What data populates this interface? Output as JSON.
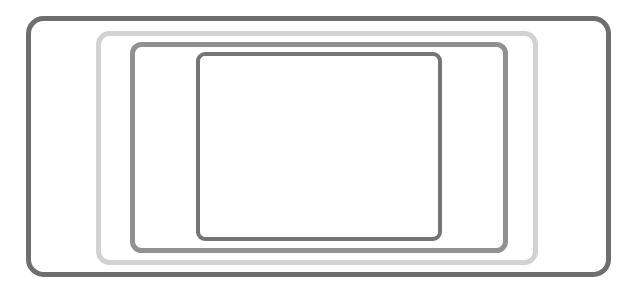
{
  "canvas": {
    "width": 637,
    "height": 293,
    "background_color": "#ffffff",
    "description": "Four nested rounded rectangle outlines of varying gray tones on a plain white background"
  },
  "figure": {
    "title": "",
    "shape_count": 4,
    "shape_kind": "rounded-rectangle-outline"
  },
  "shapes": [
    {
      "name": "outer-frame",
      "order": 1,
      "stroke_color": "#6e6e6e",
      "stroke_width": 5,
      "corner_radius": 15,
      "fill": "none",
      "x": 28.5,
      "y": 18.5,
      "width": 580,
      "height": 256
    },
    {
      "name": "second-frame",
      "order": 2,
      "stroke_color": "#d2d2d2",
      "stroke_width": 5,
      "corner_radius": 11,
      "fill": "none",
      "x": 98.5,
      "y": 33.5,
      "width": 437,
      "height": 229
    },
    {
      "name": "third-frame",
      "order": 3,
      "stroke_color": "#919191",
      "stroke_width": 5,
      "corner_radius": 9,
      "fill": "none",
      "x": 132.5,
      "y": 44.5,
      "width": 373,
      "height": 206
    },
    {
      "name": "inner-frame",
      "order": 4,
      "stroke_color": "#757575",
      "stroke_width": 4,
      "corner_radius": 7,
      "fill": "none",
      "x": 198,
      "y": 54,
      "width": 242,
      "height": 185
    }
  ]
}
